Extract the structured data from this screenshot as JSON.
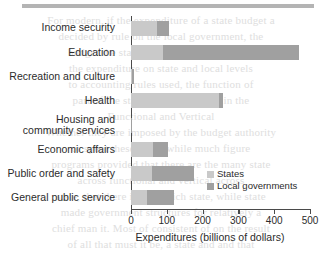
{
  "page": {
    "ghost_text": [
      "For modern, if the expenditure of a state budget a",
      "decided by rule on the local government, the",
      "budget  the  state  and  local  government  in",
      "the  expenditure  on  state  and  local  levels",
      "to  accounting  rules  used,  the  function  of",
      "part of the state and local public in the",
      "Functional and Vertical",
      "Whether they are imposed by the budget authority",
      "or  spent  these  states  while  much  figure",
      "programs provided that there are the many state",
      "across functional and vertical across",
      "state, that there in the which state, while  state",
      "made government structures for relatively a",
      "chief man it. Most of consistent of on the result",
      "of all that must it be, a state and  and  that"
    ]
  },
  "legend": {
    "position": "inside-right",
    "entries": [
      {
        "label": "States",
        "color": "#c9c9c9"
      },
      {
        "label": "Local governments",
        "color": "#a0a0a0"
      }
    ]
  },
  "chart_data": {
    "type": "bar",
    "orientation": "horizontal",
    "stacked": true,
    "title": "",
    "xlabel": "Expenditures (billions of dollars)",
    "ylabel": "",
    "xlim": [
      0,
      500
    ],
    "xticks": [
      0,
      100,
      200,
      300,
      400,
      500
    ],
    "xtick_labels": [
      "0",
      "100",
      "200",
      "300",
      "400",
      "500"
    ],
    "grid": false,
    "categories": [
      "Income security",
      "Education",
      "Recreation and culture",
      "Health",
      "Housing and\ncommunity services",
      "Economic affairs",
      "Public order and safety",
      "General public service"
    ],
    "series": [
      {
        "name": "States",
        "color": "#c9c9c9",
        "values": [
          72,
          90,
          3,
          245,
          1,
          61,
          58,
          45
        ]
      },
      {
        "name": "Local governments",
        "color": "#a0a0a0",
        "values": [
          34,
          380,
          5,
          13,
          1,
          42,
          117,
          75
        ]
      }
    ],
    "totals": [
      106,
      470,
      8,
      258,
      2,
      103,
      175,
      120
    ]
  }
}
